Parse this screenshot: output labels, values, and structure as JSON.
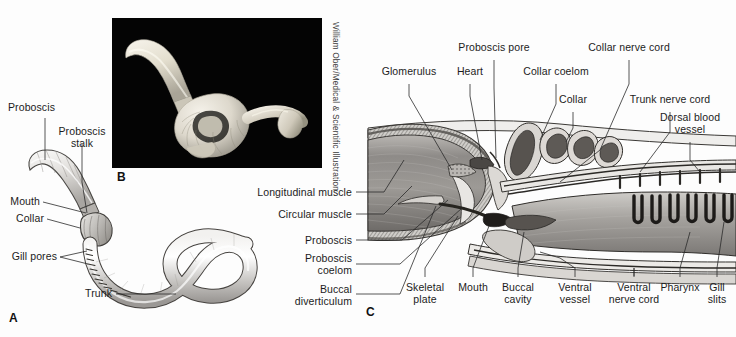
{
  "figure": {
    "background_color": "#fdfdfd",
    "ink_color": "#1c1c1c"
  },
  "panels": [
    {
      "id": "A",
      "letter": "A",
      "caption": "External view of acorn worm"
    },
    {
      "id": "B",
      "letter": "B",
      "caption": "Photograph of preserved specimen"
    },
    {
      "id": "C",
      "letter": "C",
      "caption": "Longitudinal section of anterior end"
    }
  ],
  "panel_a": {
    "letter": "A",
    "labels": [
      {
        "name": "proboscis",
        "text": "Proboscis",
        "x": 8,
        "y": 106,
        "align": "left"
      },
      {
        "name": "proboscis-stalk",
        "text": "Proboscis\nstalk",
        "x": 82,
        "y": 131,
        "align": "center"
      },
      {
        "name": "mouth",
        "text": "Mouth",
        "x": 40,
        "y": 199,
        "align": "right"
      },
      {
        "name": "collar",
        "text": "Collar",
        "x": 44,
        "y": 216,
        "align": "right"
      },
      {
        "name": "gill-pores",
        "text": "Gill pores",
        "x": 57,
        "y": 254,
        "align": "right"
      },
      {
        "name": "trunk",
        "text": "Trunk",
        "x": 112,
        "y": 291,
        "align": "right"
      }
    ]
  },
  "panel_b": {
    "letter": "B",
    "credit": "William Ober/Medical & Scientific Illustration",
    "background_color": "#050505",
    "frame": {
      "x": 112,
      "y": 18,
      "w": 210,
      "h": 150
    }
  },
  "panel_c": {
    "letter": "C",
    "labels_top": [
      {
        "name": "glomerulus",
        "text": "Glomerulus",
        "x": 409,
        "y": 72,
        "align": "center"
      },
      {
        "name": "heart",
        "text": "Heart",
        "x": 470,
        "y": 72,
        "align": "center"
      },
      {
        "name": "proboscis-pore",
        "text": "Proboscis pore",
        "x": 494,
        "y": 48,
        "align": "center"
      },
      {
        "name": "collar-coelom",
        "text": "Collar coelom",
        "x": 556,
        "y": 72,
        "align": "center"
      },
      {
        "name": "collar",
        "text": "Collar",
        "x": 573,
        "y": 100,
        "align": "center"
      },
      {
        "name": "collar-nerve-cord",
        "text": "Collar nerve cord",
        "x": 629,
        "y": 48,
        "align": "center"
      },
      {
        "name": "trunk-nerve-cord",
        "text": "Trunk nerve cord",
        "x": 670,
        "y": 100,
        "align": "center"
      },
      {
        "name": "dorsal-blood-vessel",
        "text": "Dorsal blood\nvessel",
        "x": 690,
        "y": 118,
        "align": "center"
      }
    ],
    "labels_left": [
      {
        "name": "longitudinal-muscle",
        "text": "Longitudinal muscle",
        "x": 352,
        "y": 192,
        "align": "right"
      },
      {
        "name": "circular-muscle",
        "text": "Circular muscle",
        "x": 352,
        "y": 214,
        "align": "right"
      },
      {
        "name": "proboscis",
        "text": "Proboscis",
        "x": 352,
        "y": 240,
        "align": "right"
      },
      {
        "name": "proboscis-coelom",
        "text": "Proboscis\ncoelom",
        "x": 352,
        "y": 258,
        "align": "right"
      },
      {
        "name": "buccal-diverticulum",
        "text": "Buccal\ndiverticulum",
        "x": 352,
        "y": 289,
        "align": "right"
      }
    ],
    "labels_bottom": [
      {
        "name": "skeletal-plate",
        "text": "Skeletal\nplate",
        "x": 425,
        "y": 289,
        "align": "center"
      },
      {
        "name": "mouth",
        "text": "Mouth",
        "x": 473,
        "y": 289,
        "align": "center"
      },
      {
        "name": "buccal-cavity",
        "text": "Buccal\ncavity",
        "x": 518,
        "y": 289,
        "align": "center"
      },
      {
        "name": "ventral-vessel",
        "text": "Ventral\nvessel",
        "x": 575,
        "y": 289,
        "align": "center"
      },
      {
        "name": "ventral-nerve-cord",
        "text": "Ventral\nnerve cord",
        "x": 634,
        "y": 289,
        "align": "center"
      },
      {
        "name": "pharynx",
        "text": "Pharynx",
        "x": 680,
        "y": 289,
        "align": "center"
      },
      {
        "name": "gill-slits",
        "text": "Gill\nslits",
        "x": 717,
        "y": 289,
        "align": "center"
      }
    ],
    "structures": {
      "gill_slit_count": 6,
      "dorsal_vessel_tick_count": 6
    }
  }
}
